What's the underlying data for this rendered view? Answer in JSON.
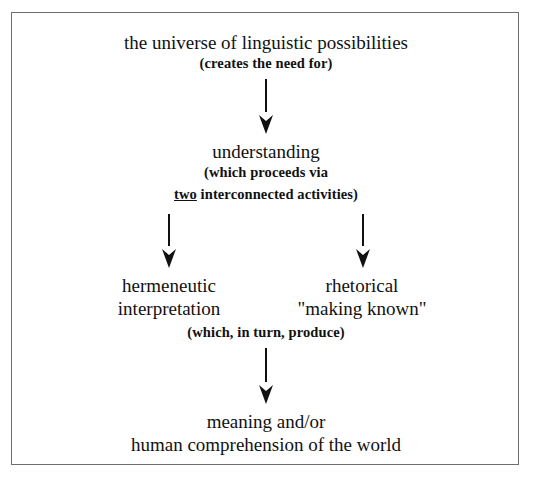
{
  "diagram": {
    "top": {
      "title": "the universe of linguistic possibilities",
      "note": "(creates the need for)"
    },
    "middle": {
      "title": "understanding",
      "note_line1": "(which proceeds via",
      "note_line2_emph": "two",
      "note_line2_rest": " interconnected activities)"
    },
    "left_branch": {
      "line1": "hermeneutic",
      "line2": "interpretation"
    },
    "right_branch": {
      "line1": "rhetorical",
      "line2": "\"making known\""
    },
    "join_note": "(which, in turn, produce)",
    "bottom": {
      "line1": "meaning and/or",
      "line2": "human comprehension of the world"
    },
    "edges": [
      {
        "from": "the universe of linguistic possibilities",
        "to": "understanding"
      },
      {
        "from": "understanding",
        "to": "hermeneutic interpretation"
      },
      {
        "from": "understanding",
        "to": "rhetorical \"making known\""
      },
      {
        "from": "hermeneutic interpretation / rhetorical \"making known\"",
        "to": "meaning and/or human comprehension of the world"
      }
    ]
  }
}
